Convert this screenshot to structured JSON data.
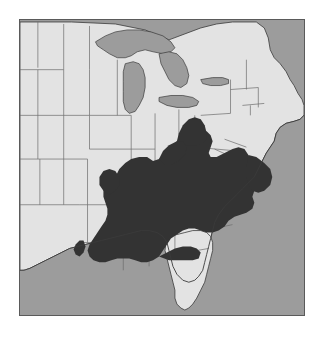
{
  "figure": {
    "type": "distribution-range-map",
    "region": "Eastern United States",
    "title": "",
    "caption": ""
  },
  "colors": {
    "page_background": "#ffffff",
    "ocean": "#9c9c9c",
    "lake": "#9c9c9c",
    "land": "#e3e3e3",
    "range_shading": "#333333",
    "state_border": "#6b6b6b",
    "coastline": "#3a3a3a",
    "frame_border": "#5a5a5a"
  },
  "legend": {
    "present": false,
    "entries": [
      {
        "swatch": "#333333",
        "label": "Range (shaded)"
      },
      {
        "swatch": "#e3e3e3",
        "label": "Land outside range"
      },
      {
        "swatch": "#9c9c9c",
        "label": "Water"
      }
    ]
  },
  "map": {
    "frame": {
      "x": 19,
      "y": 19,
      "width": 286,
      "height": 297
    },
    "water_bodies": [
      "Atlantic Ocean",
      "Gulf of Mexico",
      "Lake Superior",
      "Lake Michigan",
      "Lake Huron",
      "Lake Erie",
      "Lake Ontario"
    ],
    "states_shaded": [
      "Tennessee",
      "Kentucky",
      "Alabama",
      "Mississippi",
      "Georgia",
      "South Carolina",
      "North Carolina",
      "Virginia",
      "West Virginia",
      "southern Ohio",
      "southern Indiana",
      "southern Illinois",
      "Florida panhandle",
      "eastern Louisiana",
      "southwestern Pennsylvania"
    ],
    "states_unshaded": [
      "Minnesota",
      "Wisconsin",
      "Iowa",
      "Missouri",
      "Arkansas",
      "Louisiana",
      "Michigan",
      "Illinois",
      "Indiana",
      "Ohio",
      "Pennsylvania",
      "New York",
      "New England",
      "New Jersey",
      "Maryland",
      "Delaware",
      "Florida peninsula",
      "North Dakota",
      "South Dakota",
      "Nebraska",
      "Kansas",
      "Oklahoma",
      "Texas"
    ]
  }
}
